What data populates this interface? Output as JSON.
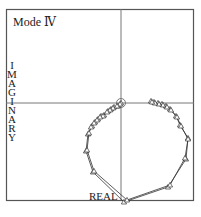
{
  "chart_data": {
    "type": "line",
    "xlabel": "REAL",
    "ylabel": "IMAGINARY",
    "grid": false,
    "origin_marker": "circle",
    "marker": "triangle",
    "series": [
      {
        "name": "curve-a",
        "points_px": [
          [
            121,
            103
          ],
          [
            118,
            106
          ],
          [
            114,
            107
          ],
          [
            111,
            109
          ],
          [
            108,
            111
          ],
          [
            104,
            115
          ],
          [
            101,
            116
          ],
          [
            98,
            119
          ],
          [
            95,
            122
          ],
          [
            92,
            126
          ],
          [
            88,
            134
          ],
          [
            86,
            151
          ],
          [
            93,
            172
          ],
          [
            124,
            202
          ],
          [
            168,
            187
          ],
          [
            186,
            159
          ],
          [
            188,
            138
          ],
          [
            180,
            125
          ],
          [
            176,
            116
          ],
          [
            170,
            109
          ],
          [
            166,
            106
          ],
          [
            162,
            104
          ],
          [
            158,
            103
          ],
          [
            154,
            102
          ],
          [
            151,
            101
          ]
        ]
      },
      {
        "name": "curve-b",
        "points_px": [
          [
            120,
            104
          ],
          [
            117,
            106
          ],
          [
            113,
            108
          ],
          [
            110,
            110
          ],
          [
            107,
            112
          ],
          [
            103,
            116
          ],
          [
            100,
            117
          ],
          [
            97,
            120
          ],
          [
            94,
            123
          ],
          [
            91,
            127
          ],
          [
            89,
            133
          ],
          [
            87,
            150
          ],
          [
            94,
            171
          ],
          [
            127,
            200
          ],
          [
            170,
            185
          ],
          [
            185,
            158
          ],
          [
            188,
            139
          ],
          [
            181,
            126
          ],
          [
            177,
            117
          ],
          [
            171,
            110
          ],
          [
            167,
            107
          ],
          [
            163,
            105
          ],
          [
            159,
            104
          ],
          [
            155,
            103
          ],
          [
            152,
            102
          ]
        ]
      }
    ]
  },
  "labels": {
    "title": "Mode Ⅳ",
    "ylabel": [
      "I",
      "M",
      "A",
      "G",
      "I",
      "N",
      "A",
      "R",
      "Y"
    ],
    "xlabel": "REAL"
  }
}
